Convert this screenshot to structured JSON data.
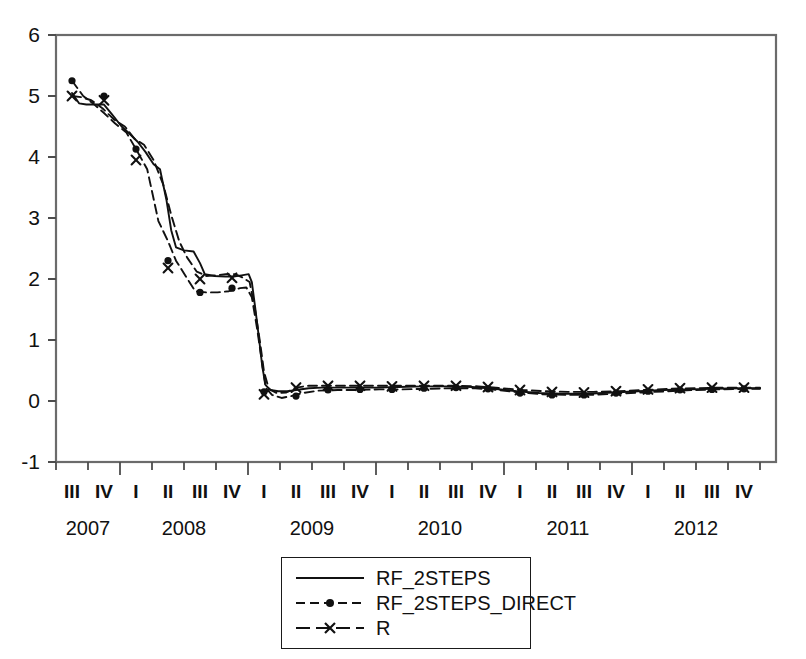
{
  "chart_data": {
    "type": "line",
    "title": "",
    "xlabel": "",
    "ylabel": "",
    "ylim": [
      -1,
      6
    ],
    "yticks": [
      -1,
      0,
      1,
      2,
      3,
      4,
      5,
      6
    ],
    "grid": false,
    "legend_position": "bottom-center",
    "x": [
      "2007 III",
      "2007 IV",
      "2008 I",
      "2008 II",
      "2008 III",
      "2008 IV",
      "2009 I",
      "2009 II",
      "2009 III",
      "2009 IV",
      "2010 I",
      "2010 II",
      "2010 III",
      "2010 IV",
      "2011 I",
      "2011 II",
      "2011 III",
      "2011 IV",
      "2012 I",
      "2012 II",
      "2012 III",
      "2012 IV"
    ],
    "quarters": [
      "III",
      "IV",
      "I",
      "II",
      "III",
      "IV",
      "I",
      "II",
      "III",
      "IV",
      "I",
      "II",
      "III",
      "IV",
      "I",
      "II",
      "III",
      "IV",
      "I",
      "II",
      "III",
      "IV"
    ],
    "years": [
      "2007",
      "2008",
      "2009",
      "2010",
      "2011",
      "2012"
    ],
    "series": [
      {
        "name": "RF_2STEPS",
        "style": "solid",
        "marker": "none",
        "color": "#111111",
        "values": [
          5.05,
          4.86,
          4.86,
          4.6,
          4.32,
          4.12,
          3.82,
          3.78,
          2.5,
          2.47,
          2.05,
          2.03,
          2.03,
          2.02,
          2.04,
          2.05,
          1.32,
          0.6,
          0.2,
          0.1,
          0.14,
          0.2
        ],
        "values_quarterly": [
          5.05,
          4.86,
          4.32,
          2.5,
          2.03,
          2.05,
          0.2,
          0.16,
          0.22,
          0.22,
          0.22,
          0.23,
          0.24,
          0.22,
          0.16,
          0.13,
          0.12,
          0.14,
          0.17,
          0.19,
          0.2,
          0.21
        ]
      },
      {
        "name": "RF_2STEPS_DIRECT",
        "style": "dashed",
        "marker": "circle",
        "color": "#111111",
        "values_quarterly": [
          5.25,
          5.0,
          4.13,
          2.3,
          1.78,
          1.85,
          0.15,
          0.08,
          0.18,
          0.19,
          0.19,
          0.21,
          0.22,
          0.2,
          0.13,
          0.1,
          0.1,
          0.13,
          0.16,
          0.18,
          0.19,
          0.2
        ]
      },
      {
        "name": "R",
        "style": "dashed",
        "marker": "cross",
        "color": "#111111",
        "values_quarterly": [
          5.0,
          4.93,
          3.95,
          2.18,
          2.0,
          2.02,
          0.11,
          0.22,
          0.25,
          0.25,
          0.24,
          0.25,
          0.25,
          0.23,
          0.18,
          0.15,
          0.14,
          0.16,
          0.19,
          0.21,
          0.22,
          0.22
        ]
      }
    ],
    "series_dense": {
      "RF_2STEPS": [
        [
          0.0,
          5.05
        ],
        [
          0.22,
          4.88
        ],
        [
          0.45,
          4.86
        ],
        [
          0.72,
          4.86
        ],
        [
          1.0,
          4.86
        ],
        [
          1.25,
          4.7
        ],
        [
          1.55,
          4.5
        ],
        [
          1.8,
          4.38
        ],
        [
          2.05,
          4.25
        ],
        [
          2.3,
          4.08
        ],
        [
          2.55,
          3.88
        ],
        [
          2.75,
          3.8
        ],
        [
          2.95,
          3.3
        ],
        [
          3.1,
          2.8
        ],
        [
          3.25,
          2.52
        ],
        [
          3.5,
          2.47
        ],
        [
          3.8,
          2.45
        ],
        [
          4.0,
          2.26
        ],
        [
          4.15,
          2.08
        ],
        [
          4.45,
          2.05
        ],
        [
          4.8,
          2.04
        ],
        [
          5.05,
          2.04
        ],
        [
          5.3,
          2.06
        ],
        [
          5.52,
          2.08
        ],
        [
          5.62,
          1.95
        ],
        [
          5.72,
          1.55
        ],
        [
          5.85,
          1.0
        ],
        [
          5.95,
          0.55
        ],
        [
          6.05,
          0.26
        ],
        [
          6.2,
          0.18
        ],
        [
          6.45,
          0.16
        ],
        [
          6.75,
          0.16
        ],
        [
          7.0,
          0.18
        ],
        [
          7.4,
          0.21
        ],
        [
          7.8,
          0.22
        ],
        [
          8.3,
          0.22
        ],
        [
          8.9,
          0.22
        ],
        [
          9.5,
          0.22
        ],
        [
          10.2,
          0.23
        ],
        [
          11.0,
          0.24
        ],
        [
          11.8,
          0.24
        ],
        [
          12.5,
          0.23
        ],
        [
          13.2,
          0.2
        ],
        [
          13.9,
          0.16
        ],
        [
          14.6,
          0.13
        ],
        [
          15.3,
          0.12
        ],
        [
          16.1,
          0.12
        ],
        [
          16.9,
          0.14
        ],
        [
          17.7,
          0.16
        ],
        [
          18.5,
          0.18
        ],
        [
          19.3,
          0.19
        ],
        [
          20.1,
          0.2
        ],
        [
          20.9,
          0.21
        ],
        [
          21.5,
          0.21
        ]
      ],
      "RF_2STEPS_DIRECT": [
        [
          0.0,
          5.25
        ],
        [
          0.35,
          5.0
        ],
        [
          0.7,
          4.86
        ],
        [
          1.0,
          4.72
        ],
        [
          1.35,
          4.55
        ],
        [
          1.7,
          4.4
        ],
        [
          2.0,
          4.13
        ],
        [
          2.35,
          3.8
        ],
        [
          2.7,
          2.95
        ],
        [
          3.0,
          2.62
        ],
        [
          3.25,
          2.3
        ],
        [
          3.55,
          2.05
        ],
        [
          3.85,
          1.8
        ],
        [
          4.2,
          1.78
        ],
        [
          4.55,
          1.78
        ],
        [
          4.9,
          1.8
        ],
        [
          5.25,
          1.85
        ],
        [
          5.45,
          1.86
        ],
        [
          5.62,
          1.7
        ],
        [
          5.78,
          1.2
        ],
        [
          5.92,
          0.7
        ],
        [
          6.05,
          0.22
        ],
        [
          6.25,
          0.1
        ],
        [
          6.55,
          0.05
        ],
        [
          6.85,
          0.08
        ],
        [
          7.2,
          0.13
        ],
        [
          7.7,
          0.17
        ],
        [
          8.3,
          0.18
        ],
        [
          8.9,
          0.18
        ],
        [
          9.6,
          0.19
        ],
        [
          10.3,
          0.19
        ],
        [
          11.1,
          0.2
        ],
        [
          11.9,
          0.21
        ],
        [
          12.6,
          0.21
        ],
        [
          13.3,
          0.18
        ],
        [
          14.0,
          0.14
        ],
        [
          14.7,
          0.11
        ],
        [
          15.4,
          0.1
        ],
        [
          16.2,
          0.1
        ],
        [
          17.0,
          0.12
        ],
        [
          17.8,
          0.14
        ],
        [
          18.6,
          0.16
        ],
        [
          19.4,
          0.18
        ],
        [
          20.2,
          0.19
        ],
        [
          21.0,
          0.2
        ],
        [
          21.5,
          0.2
        ]
      ],
      "R": [
        [
          0.0,
          5.0
        ],
        [
          0.3,
          4.98
        ],
        [
          0.6,
          4.93
        ],
        [
          0.95,
          4.8
        ],
        [
          1.3,
          4.62
        ],
        [
          1.65,
          4.5
        ],
        [
          1.95,
          4.3
        ],
        [
          2.25,
          4.2
        ],
        [
          2.55,
          3.95
        ],
        [
          2.85,
          3.55
        ],
        [
          3.1,
          3.05
        ],
        [
          3.35,
          2.62
        ],
        [
          3.6,
          2.35
        ],
        [
          3.9,
          2.12
        ],
        [
          4.2,
          2.05
        ],
        [
          4.5,
          2.06
        ],
        [
          4.8,
          2.08
        ],
        [
          5.1,
          2.08
        ],
        [
          5.35,
          2.02
        ],
        [
          5.55,
          1.95
        ],
        [
          5.72,
          1.5
        ],
        [
          5.88,
          0.95
        ],
        [
          6.0,
          0.48
        ],
        [
          6.15,
          0.2
        ],
        [
          6.4,
          0.13
        ],
        [
          6.7,
          0.14
        ],
        [
          7.0,
          0.22
        ],
        [
          7.4,
          0.25
        ],
        [
          7.9,
          0.25
        ],
        [
          8.5,
          0.25
        ],
        [
          9.1,
          0.25
        ],
        [
          9.8,
          0.25
        ],
        [
          10.5,
          0.25
        ],
        [
          11.2,
          0.25
        ],
        [
          12.0,
          0.25
        ],
        [
          12.7,
          0.24
        ],
        [
          13.4,
          0.21
        ],
        [
          14.1,
          0.18
        ],
        [
          14.8,
          0.16
        ],
        [
          15.5,
          0.15
        ],
        [
          16.3,
          0.15
        ],
        [
          17.1,
          0.16
        ],
        [
          17.9,
          0.18
        ],
        [
          18.7,
          0.2
        ],
        [
          19.5,
          0.21
        ],
        [
          20.3,
          0.22
        ],
        [
          21.1,
          0.22
        ],
        [
          21.5,
          0.22
        ]
      ]
    }
  },
  "legend": {
    "items": [
      {
        "label": "RF_2STEPS",
        "sample": "solid-line-sample"
      },
      {
        "label": "RF_2STEPS_DIRECT",
        "sample": "dashed-circle-sample"
      },
      {
        "label": "R",
        "sample": "dashed-cross-sample"
      }
    ]
  },
  "axis": {
    "y_tick_labels": [
      "6",
      "5",
      "4",
      "3",
      "2",
      "1",
      "0",
      "-1"
    ]
  },
  "colors": {
    "line": "#111111",
    "frame": "#6b6b6b",
    "background": "#ffffff"
  }
}
